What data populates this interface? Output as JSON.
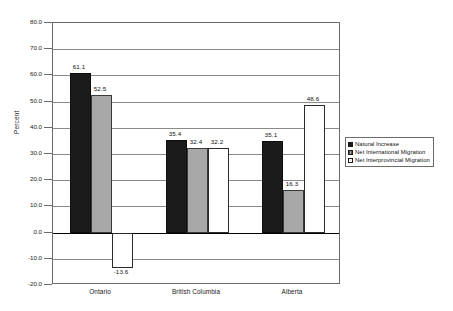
{
  "chart_data": {
    "type": "bar",
    "title": "",
    "xlabel": "",
    "ylabel": "Percent",
    "ylim": [
      -20.0,
      80.0
    ],
    "ytick_labels": [
      "80.0",
      "70.0",
      "60.0",
      "50.0",
      "40.0",
      "30.0",
      "20.0",
      "10.0",
      "0.0",
      "-10.0",
      "-20.0"
    ],
    "ytick_values": [
      80.0,
      70.0,
      60.0,
      50.0,
      40.0,
      30.0,
      20.0,
      10.0,
      0.0,
      -10.0,
      -20.0
    ],
    "grid": true,
    "legend_position": "right",
    "categories": [
      "Ontario",
      "British Columbia",
      "Alberta"
    ],
    "series": [
      {
        "name": "Natural Increase",
        "color": "#1b1b1b",
        "values": [
          61.1,
          35.4,
          35.1
        ],
        "labels": [
          "61.1",
          "35.4",
          "35.1"
        ]
      },
      {
        "name": "Net International Migration",
        "color": "#a8a8a8",
        "values": [
          52.5,
          32.4,
          16.3
        ],
        "labels": [
          "52.5",
          "32.4",
          "16.3"
        ]
      },
      {
        "name": "Net Interprovincial Migration",
        "color": "#ffffff",
        "values": [
          -13.6,
          32.2,
          48.6
        ],
        "labels": [
          "-13.6",
          "32.2",
          "48.6"
        ]
      }
    ]
  },
  "legend": {
    "items": [
      {
        "label": "Natural Increase"
      },
      {
        "label": "Net International Migration"
      },
      {
        "label": "Net Interprovincial Migration"
      }
    ]
  }
}
